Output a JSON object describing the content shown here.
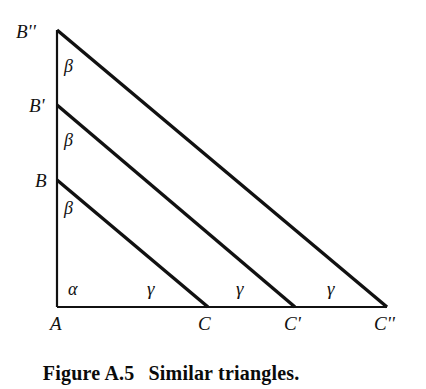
{
  "figure": {
    "caption_label": "Figure A.5",
    "caption_text": "Similar triangles.",
    "background_color": "#ffffff",
    "stroke_color": "#111111"
  },
  "diagram": {
    "type": "geometry-figure",
    "vertices": [
      {
        "id": "A",
        "label": "A",
        "x": 57,
        "y": 307
      },
      {
        "id": "B",
        "label": "B",
        "x": 57,
        "y": 180
      },
      {
        "id": "Bprime",
        "label": "B'",
        "x": 57,
        "y": 105
      },
      {
        "id": "Bdprime",
        "label": "B''",
        "x": 57,
        "y": 30
      },
      {
        "id": "C",
        "label": "C",
        "x": 208,
        "y": 307
      },
      {
        "id": "Cprime",
        "label": "C'",
        "x": 295,
        "y": 307
      },
      {
        "id": "Cdprime",
        "label": "C''",
        "x": 387,
        "y": 307
      }
    ],
    "vertex_labels": [
      {
        "name": "vertex-label-b-double-prime",
        "text": "B''",
        "x": 16,
        "y": 22
      },
      {
        "name": "vertex-label-b-prime",
        "text": "B'",
        "x": 29,
        "y": 96
      },
      {
        "name": "vertex-label-b",
        "text": "B",
        "x": 35,
        "y": 171
      },
      {
        "name": "vertex-label-a",
        "text": "A",
        "x": 50,
        "y": 314
      },
      {
        "name": "vertex-label-c",
        "text": "C",
        "x": 198,
        "y": 314
      },
      {
        "name": "vertex-label-c-prime",
        "text": "C'",
        "x": 284,
        "y": 314
      },
      {
        "name": "vertex-label-c-double-prime",
        "text": "C''",
        "x": 374,
        "y": 314
      }
    ],
    "segments": [
      {
        "name": "vertical-leg-a-to-b-double-prime",
        "x1": 57,
        "y1": 30,
        "x2": 57,
        "y2": 307,
        "width": 2.2
      },
      {
        "name": "baseline-a-to-c-double-prime",
        "x1": 57,
        "y1": 307,
        "x2": 387,
        "y2": 307,
        "width": 2.2
      },
      {
        "name": "hypotenuse-b-to-c",
        "x1": 57,
        "y1": 180,
        "x2": 208,
        "y2": 307,
        "width": 3.4
      },
      {
        "name": "hypotenuse-b-prime-to-c-prime",
        "x1": 57,
        "y1": 105,
        "x2": 295,
        "y2": 307,
        "width": 3.4
      },
      {
        "name": "hypotenuse-b-double-prime-to-c-double-prime",
        "x1": 57,
        "y1": 30,
        "x2": 387,
        "y2": 307,
        "width": 3.4
      }
    ],
    "angle_labels": [
      {
        "name": "angle-beta-top",
        "text": "β",
        "x": 64,
        "y": 57
      },
      {
        "name": "angle-beta-middle",
        "text": "β",
        "x": 64,
        "y": 131
      },
      {
        "name": "angle-beta-bottom",
        "text": "β",
        "x": 64,
        "y": 199
      },
      {
        "name": "angle-alpha",
        "text": "α",
        "x": 68,
        "y": 280
      },
      {
        "name": "angle-gamma-first",
        "text": "γ",
        "x": 147,
        "y": 279
      },
      {
        "name": "angle-gamma-second",
        "text": "γ",
        "x": 236,
        "y": 279
      },
      {
        "name": "angle-gamma-third",
        "text": "γ",
        "x": 327,
        "y": 279
      }
    ]
  }
}
